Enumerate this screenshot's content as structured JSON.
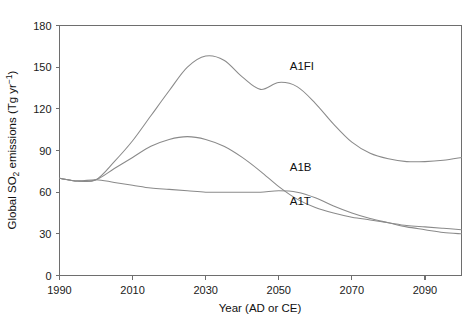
{
  "chart_data": {
    "type": "line",
    "title": "",
    "xlabel": "Year (AD or CE)",
    "ylabel": "Global SO2 emissions (Tg yr-1)",
    "ylabel_parts": {
      "lead": "Global SO",
      "sub": "2",
      "mid": " emissions (Tg yr",
      "sup": "−1",
      "tail": ")"
    },
    "xlim": [
      1990,
      2100
    ],
    "ylim": [
      0,
      180
    ],
    "xticks": [
      1990,
      2010,
      2030,
      2050,
      2070,
      2090
    ],
    "yticks": [
      0,
      30,
      60,
      90,
      120,
      150,
      180
    ],
    "xtick_labels": [
      "1990",
      "2010",
      "2030",
      "2050",
      "2070",
      "2090"
    ],
    "ytick_labels": [
      "0",
      "30",
      "60",
      "90",
      "120",
      "150",
      "180"
    ],
    "grid": false,
    "legend_position": "inline-labels",
    "line_color": "#8a8a8a",
    "axis_color": "#6e6e6e",
    "background_color": "#ffffff",
    "series": [
      {
        "name": "A1FI",
        "label": "A1FI",
        "label_x": 2053,
        "label_y": 148,
        "x": [
          1990,
          1995,
          2000,
          2005,
          2010,
          2015,
          2020,
          2025,
          2030,
          2035,
          2040,
          2045,
          2050,
          2055,
          2060,
          2065,
          2070,
          2075,
          2080,
          2085,
          2090,
          2095,
          2100
        ],
        "values": [
          70,
          68,
          69,
          82,
          97,
          115,
          133,
          150,
          158,
          155,
          143,
          134,
          139,
          136,
          124,
          109,
          96,
          88,
          84,
          82,
          82,
          83,
          85
        ]
      },
      {
        "name": "A1B",
        "label": "A1B",
        "label_x": 2053,
        "label_y": 75,
        "x": [
          1990,
          1995,
          2000,
          2005,
          2010,
          2015,
          2020,
          2025,
          2030,
          2035,
          2040,
          2045,
          2050,
          2055,
          2060,
          2065,
          2070,
          2075,
          2080,
          2085,
          2090,
          2095,
          2100
        ],
        "values": [
          70,
          68,
          69,
          77,
          85,
          93,
          98,
          100,
          98,
          93,
          85,
          75,
          64,
          55,
          49,
          45,
          42,
          40,
          38,
          36,
          35,
          34,
          33
        ]
      },
      {
        "name": "A1T",
        "label": "A1T",
        "label_x": 2053,
        "label_y": 51,
        "x": [
          1990,
          1995,
          2000,
          2005,
          2010,
          2015,
          2020,
          2025,
          2030,
          2035,
          2040,
          2045,
          2050,
          2055,
          2060,
          2065,
          2070,
          2075,
          2080,
          2085,
          2090,
          2095,
          2100
        ],
        "values": [
          70,
          68,
          69,
          67,
          65,
          63,
          62,
          61,
          60,
          60,
          60,
          60,
          61,
          60,
          56,
          50,
          45,
          41,
          38,
          35,
          33,
          31,
          30
        ]
      }
    ]
  }
}
